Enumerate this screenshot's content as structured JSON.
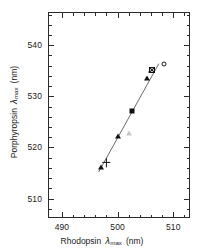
{
  "chart_data": {
    "type": "scatter",
    "title": "",
    "xlabel": "Rhodopsin λmax (nm)",
    "xlabel_main": "Rhodopsin",
    "xlabel_symbol": "λ",
    "xlabel_sub": "max",
    "xlabel_unit": "(nm)",
    "ylabel": "Porphyropsin λmax (nm)",
    "ylabel_main": "Porphyropsin",
    "ylabel_symbol": "λ",
    "ylabel_sub": "max",
    "ylabel_unit": "(nm)",
    "xlim": [
      487.5,
      513.0
    ],
    "ylim": [
      506.2,
      546.5
    ],
    "xticks_major": [
      490,
      500,
      510
    ],
    "xticks_major_labels": [
      "490",
      "500",
      "510"
    ],
    "xticks_minor": [
      492,
      494,
      496,
      498,
      502,
      504,
      506,
      508,
      512
    ],
    "yticks_major": [
      510,
      520,
      530,
      540
    ],
    "yticks_major_labels": [
      "510",
      "520",
      "530",
      "540"
    ],
    "yticks_minor": [
      508,
      512,
      514,
      516,
      518,
      522,
      524,
      526,
      528,
      532,
      534,
      536,
      538,
      542,
      544,
      546
    ],
    "grid": false,
    "legend": false,
    "tick_direction": "in",
    "frame": "box",
    "series": [
      {
        "name": "filled-triangle",
        "marker": "triangle-filled",
        "points": [
          {
            "x": 497.0,
            "y": 516.0
          },
          {
            "x": 500.0,
            "y": 522.2
          },
          {
            "x": 505.2,
            "y": 533.4
          },
          {
            "x": 506.0,
            "y": 535.0
          }
        ]
      },
      {
        "name": "plus",
        "marker": "plus",
        "points": [
          {
            "x": 498.0,
            "y": 517.0
          }
        ]
      },
      {
        "name": "open-triangle",
        "marker": "triangle-open",
        "points": [
          {
            "x": 502.0,
            "y": 522.8
          }
        ]
      },
      {
        "name": "filled-square",
        "marker": "square-filled",
        "points": [
          {
            "x": 502.6,
            "y": 527.2
          }
        ]
      },
      {
        "name": "crossed-square",
        "marker": "square-crossed",
        "points": [
          {
            "x": 506.1,
            "y": 535.1
          }
        ]
      },
      {
        "name": "open-circle",
        "marker": "circle-open",
        "points": [
          {
            "x": 508.4,
            "y": 536.3
          }
        ]
      }
    ],
    "fit_line": {
      "x1": 496.6,
      "y1": 515.2,
      "x2": 507.4,
      "y2": 536.4
    }
  }
}
